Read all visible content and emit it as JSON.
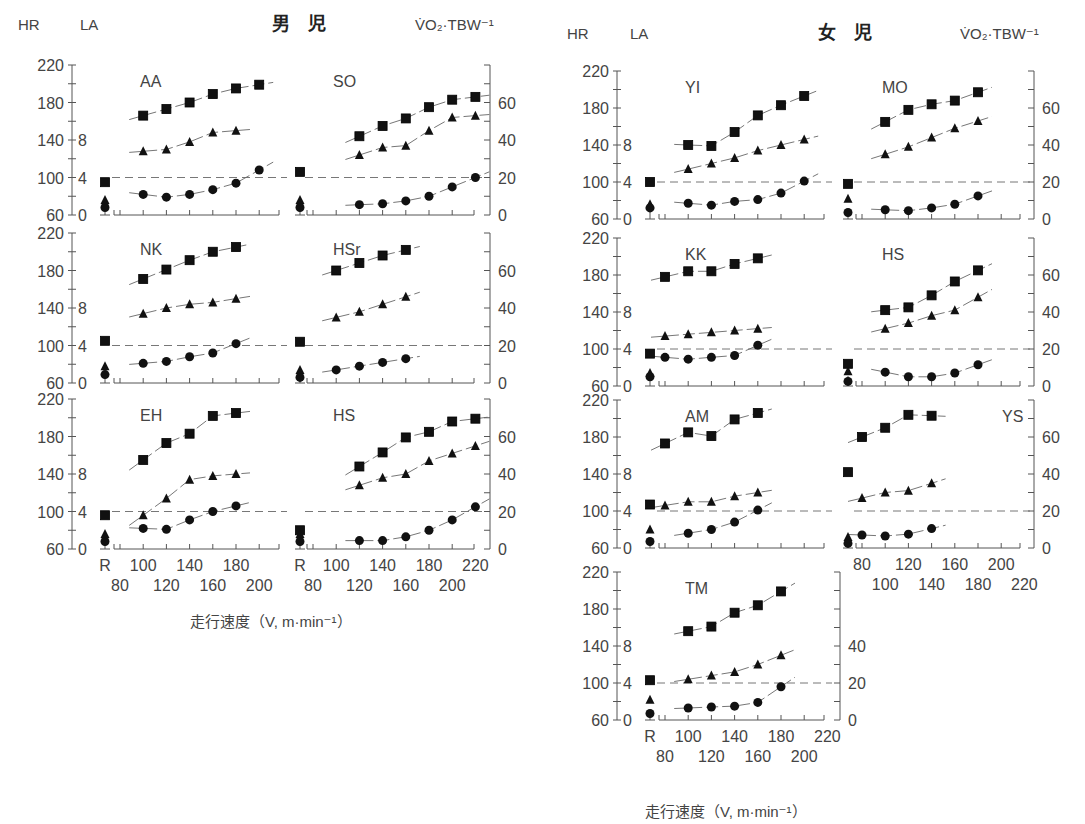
{
  "figure": {
    "groups": [
      {
        "id": "male",
        "title": "男　児",
        "hr_label": "HR",
        "la_label": "LA",
        "vo2_label": "V̇O₂·TBW⁻¹",
        "xlabel": "走行速度（V, m·min⁻¹）"
      },
      {
        "id": "female",
        "title": "女　児",
        "hr_label": "HR",
        "la_label": "LA",
        "vo2_label": "V̇O₂·TBW⁻¹",
        "xlabel": "走行速度（V, m·min⁻¹）"
      }
    ],
    "axes": {
      "hr_ticks": [
        60,
        100,
        140,
        180,
        220
      ],
      "la_ticks": [
        0,
        4,
        8
      ],
      "vo2_ticks": [
        0,
        20,
        40,
        60
      ],
      "x_ticks_top": [
        "R",
        "100",
        "140",
        "180",
        "220"
      ],
      "x_ticks_bottom": [
        "80",
        "120",
        "160",
        "200"
      ],
      "x_ticks_top_short": [
        "R",
        "100",
        "140",
        "180"
      ],
      "x_ticks_bottom_short": [
        "80",
        "120",
        "160",
        "200"
      ]
    },
    "legend_markers": {
      "square": "HR (heart rate)",
      "triangle": "V̇O₂·TBW⁻¹",
      "circle": "LA (lactate)"
    }
  },
  "chart_data": {
    "type": "scatter",
    "xlabel": "走行速度（V, m·min⁻¹）",
    "ylabel_left": "HR (60–220) / LA (0–8+)",
    "ylabel_right": "V̇O₂·TBW⁻¹ (0–80)",
    "xlim": [
      80,
      220
    ],
    "note": "R = rest values. Dashed line = LA 4 mmol reference. Squares = HR, triangles = V̇O₂·TBW⁻¹, circles = LA.",
    "panels": [
      {
        "group": "male",
        "name": "AA",
        "col": 0,
        "row": 0,
        "rest": {
          "hr": 95,
          "vo2": 8,
          "la": 0.8
        },
        "hr": [
          [
            100,
            166
          ],
          [
            120,
            173
          ],
          [
            140,
            180
          ],
          [
            160,
            189
          ],
          [
            180,
            195
          ],
          [
            200,
            199
          ]
        ],
        "vo2": [
          [
            100,
            34
          ],
          [
            120,
            35
          ],
          [
            140,
            39
          ],
          [
            160,
            44
          ],
          [
            180,
            45
          ]
        ],
        "la": [
          [
            100,
            2.2
          ],
          [
            120,
            1.9
          ],
          [
            140,
            2.2
          ],
          [
            160,
            2.7
          ],
          [
            180,
            3.4
          ],
          [
            200,
            4.8
          ]
        ]
      },
      {
        "group": "male",
        "name": "SO",
        "col": 1,
        "row": 0,
        "rest": {
          "hr": 106,
          "vo2": 8,
          "la": 0.8
        },
        "hr": [
          [
            120,
            144
          ],
          [
            140,
            155
          ],
          [
            160,
            163
          ],
          [
            180,
            175
          ],
          [
            200,
            183
          ],
          [
            220,
            186
          ]
        ],
        "vo2": [
          [
            120,
            32
          ],
          [
            140,
            36
          ],
          [
            160,
            37
          ],
          [
            180,
            45
          ],
          [
            200,
            52
          ],
          [
            220,
            53
          ]
        ],
        "la": [
          [
            120,
            1.1
          ],
          [
            140,
            1.2
          ],
          [
            160,
            1.5
          ],
          [
            180,
            2.0
          ],
          [
            200,
            3.0
          ],
          [
            220,
            4.0
          ]
        ]
      },
      {
        "group": "male",
        "name": "NK",
        "col": 0,
        "row": 1,
        "rest": {
          "hr": 105,
          "vo2": 9,
          "la": 0.9
        },
        "hr": [
          [
            100,
            171
          ],
          [
            120,
            181
          ],
          [
            140,
            191
          ],
          [
            160,
            200
          ],
          [
            180,
            205
          ]
        ],
        "vo2": [
          [
            100,
            37
          ],
          [
            120,
            40
          ],
          [
            140,
            42
          ],
          [
            160,
            43
          ],
          [
            180,
            45
          ]
        ],
        "la": [
          [
            100,
            2.1
          ],
          [
            120,
            2.3
          ],
          [
            140,
            2.8
          ],
          [
            160,
            3.2
          ],
          [
            180,
            4.2
          ]
        ]
      },
      {
        "group": "male",
        "name": "HSr",
        "col": 1,
        "row": 1,
        "rest": {
          "hr": 104,
          "vo2": 7,
          "la": 0.6
        },
        "hr": [
          [
            100,
            180
          ],
          [
            120,
            188
          ],
          [
            140,
            196
          ],
          [
            160,
            202
          ]
        ],
        "vo2": [
          [
            100,
            35
          ],
          [
            120,
            38
          ],
          [
            140,
            42
          ],
          [
            160,
            46
          ]
        ],
        "la": [
          [
            100,
            1.4
          ],
          [
            120,
            1.8
          ],
          [
            140,
            2.2
          ],
          [
            160,
            2.6
          ]
        ]
      },
      {
        "group": "male",
        "name": "EH",
        "col": 0,
        "row": 2,
        "rest": {
          "hr": 96,
          "vo2": 8,
          "la": 0.8
        },
        "hr": [
          [
            100,
            155
          ],
          [
            120,
            173
          ],
          [
            140,
            183
          ],
          [
            160,
            202
          ],
          [
            180,
            205
          ]
        ],
        "vo2": [
          [
            100,
            18
          ],
          [
            120,
            27
          ],
          [
            140,
            37
          ],
          [
            160,
            39
          ],
          [
            180,
            40
          ]
        ],
        "la": [
          [
            100,
            2.2
          ],
          [
            120,
            2.1
          ],
          [
            140,
            3.1
          ],
          [
            160,
            4.0
          ],
          [
            180,
            4.6
          ]
        ]
      },
      {
        "group": "male",
        "name": "HS",
        "col": 1,
        "row": 2,
        "rest": {
          "hr": 80,
          "vo2": 8,
          "la": 0.8
        },
        "hr": [
          [
            120,
            148
          ],
          [
            140,
            163
          ],
          [
            160,
            179
          ],
          [
            180,
            185
          ],
          [
            200,
            196
          ],
          [
            220,
            199
          ]
        ],
        "vo2": [
          [
            120,
            34
          ],
          [
            140,
            38
          ],
          [
            160,
            40
          ],
          [
            180,
            47
          ],
          [
            200,
            51
          ],
          [
            220,
            55
          ]
        ],
        "la": [
          [
            120,
            0.9
          ],
          [
            140,
            0.9
          ],
          [
            160,
            1.3
          ],
          [
            180,
            2.0
          ],
          [
            200,
            3.1
          ],
          [
            220,
            4.5
          ]
        ]
      },
      {
        "group": "female",
        "name": "YI",
        "col": 0,
        "row": 0,
        "rest": {
          "hr": 100,
          "vo2": 8,
          "la": 1.2
        },
        "hr": [
          [
            100,
            140
          ],
          [
            120,
            139
          ],
          [
            140,
            154
          ],
          [
            160,
            172
          ],
          [
            180,
            183
          ],
          [
            200,
            193
          ]
        ],
        "vo2": [
          [
            100,
            27
          ],
          [
            120,
            30
          ],
          [
            140,
            33
          ],
          [
            160,
            37
          ],
          [
            180,
            40
          ],
          [
            200,
            43
          ]
        ],
        "la": [
          [
            100,
            1.7
          ],
          [
            120,
            1.5
          ],
          [
            140,
            1.9
          ],
          [
            160,
            2.1
          ],
          [
            180,
            2.8
          ],
          [
            200,
            4.1
          ]
        ]
      },
      {
        "group": "female",
        "name": "MO",
        "col": 1,
        "row": 0,
        "rest": {
          "hr": 98,
          "vo2": 11,
          "la": 0.7
        },
        "hr": [
          [
            100,
            165
          ],
          [
            120,
            178
          ],
          [
            140,
            184
          ],
          [
            160,
            188
          ],
          [
            180,
            197
          ]
        ],
        "vo2": [
          [
            100,
            35
          ],
          [
            120,
            39
          ],
          [
            140,
            44
          ],
          [
            160,
            49
          ],
          [
            180,
            53
          ]
        ],
        "la": [
          [
            100,
            1.0
          ],
          [
            120,
            0.9
          ],
          [
            140,
            1.2
          ],
          [
            160,
            1.6
          ],
          [
            180,
            2.5
          ]
        ]
      },
      {
        "group": "female",
        "name": "KK",
        "col": 0,
        "row": 1,
        "rest": {
          "hr": 95,
          "vo2": 7,
          "la": 1.0
        },
        "hr": [
          [
            80,
            178
          ],
          [
            100,
            184
          ],
          [
            120,
            184
          ],
          [
            140,
            192
          ],
          [
            160,
            198
          ]
        ],
        "vo2": [
          [
            80,
            27
          ],
          [
            100,
            28
          ],
          [
            120,
            29
          ],
          [
            140,
            30
          ],
          [
            160,
            31
          ]
        ],
        "la": [
          [
            80,
            3.1
          ],
          [
            100,
            2.9
          ],
          [
            120,
            3.1
          ],
          [
            140,
            3.3
          ],
          [
            160,
            4.4
          ]
        ]
      },
      {
        "group": "female",
        "name": "HS",
        "col": 1,
        "row": 1,
        "rest": {
          "hr": 84,
          "vo2": 8,
          "la": 0.5
        },
        "hr": [
          [
            100,
            142
          ],
          [
            120,
            145
          ],
          [
            140,
            158
          ],
          [
            160,
            173
          ],
          [
            180,
            185
          ]
        ],
        "vo2": [
          [
            100,
            31
          ],
          [
            120,
            34
          ],
          [
            140,
            38
          ],
          [
            160,
            41
          ],
          [
            180,
            48
          ]
        ],
        "la": [
          [
            100,
            1.5
          ],
          [
            120,
            1.0
          ],
          [
            140,
            1.0
          ],
          [
            160,
            1.4
          ],
          [
            180,
            2.3
          ]
        ]
      },
      {
        "group": "female",
        "name": "AM",
        "col": 0,
        "row": 2,
        "rest": {
          "hr": 107,
          "vo2": 10,
          "la": 0.7
        },
        "hr": [
          [
            80,
            173
          ],
          [
            100,
            185
          ],
          [
            120,
            181
          ],
          [
            140,
            199
          ],
          [
            160,
            206
          ]
        ],
        "vo2": [
          [
            80,
            23
          ],
          [
            100,
            25
          ],
          [
            120,
            25
          ],
          [
            140,
            28
          ],
          [
            160,
            30
          ]
        ],
        "la": [
          [
            100,
            1.6
          ],
          [
            120,
            2.0
          ],
          [
            140,
            2.8
          ],
          [
            160,
            4.1
          ]
        ]
      },
      {
        "group": "female",
        "name": "YS",
        "col": 1,
        "row": 2,
        "rest": {
          "hr": 142,
          "vo2": 6,
          "la": 0.5
        },
        "hr": [
          [
            80,
            180
          ],
          [
            100,
            190
          ],
          [
            120,
            204
          ],
          [
            140,
            203
          ]
        ],
        "vo2": [
          [
            80,
            27
          ],
          [
            100,
            30
          ],
          [
            120,
            31
          ],
          [
            140,
            35
          ]
        ],
        "la": [
          [
            80,
            1.4
          ],
          [
            100,
            1.3
          ],
          [
            120,
            1.5
          ],
          [
            140,
            2.1
          ]
        ]
      },
      {
        "group": "female",
        "name": "TM",
        "col": 0,
        "row": 3,
        "rest": {
          "hr": 103,
          "vo2": 11,
          "la": 0.7
        },
        "hr": [
          [
            100,
            156
          ],
          [
            120,
            161
          ],
          [
            140,
            176
          ],
          [
            160,
            184
          ],
          [
            180,
            199
          ]
        ],
        "vo2": [
          [
            100,
            22
          ],
          [
            120,
            24
          ],
          [
            140,
            26
          ],
          [
            160,
            30
          ],
          [
            180,
            35
          ]
        ],
        "la": [
          [
            100,
            1.3
          ],
          [
            120,
            1.4
          ],
          [
            140,
            1.5
          ],
          [
            160,
            1.9
          ],
          [
            180,
            3.6
          ]
        ]
      }
    ]
  }
}
